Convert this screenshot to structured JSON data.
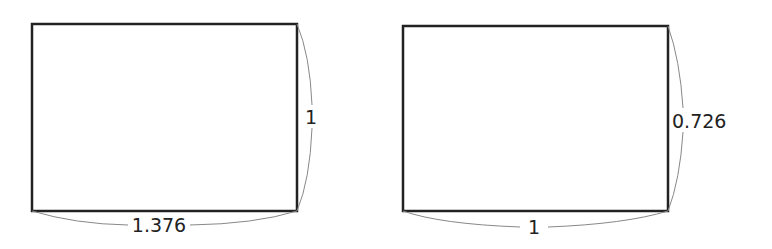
{
  "diagram": {
    "colors": {
      "rect_stroke": "#222222",
      "brace_stroke": "#888888",
      "text": "#222222"
    },
    "rectangles": [
      {
        "id": "left",
        "width_label": "1.376",
        "height_label": "1",
        "x": 32,
        "y": 24,
        "w": 265,
        "h": 187
      },
      {
        "id": "right",
        "width_label": "1",
        "height_label": "0.726",
        "x": 403,
        "y": 26,
        "w": 265,
        "h": 185
      }
    ]
  }
}
